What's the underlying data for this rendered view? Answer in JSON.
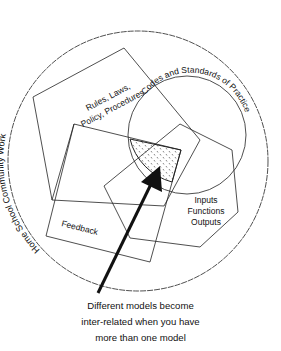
{
  "outer_circle": {
    "label_words": [
      "Home",
      "School",
      "Community",
      "Work"
    ]
  },
  "inner_circle": {
    "label": "Codes and Standards of Practice"
  },
  "pentagon": {
    "label_line1": "Rules, Laws,",
    "label_line2": "Policy, Procedures"
  },
  "rectangle": {
    "label": "Feedback"
  },
  "hexagon": {
    "label_line1": "Inputs",
    "label_line2": "Functions",
    "label_line3": "Outputs"
  },
  "caption": {
    "line1": "Different models become",
    "line2": "inter-related when you have",
    "line3": "more than one model"
  },
  "colors": {
    "stroke": "#222222",
    "background": "#ffffff",
    "stipple": "#555555"
  }
}
